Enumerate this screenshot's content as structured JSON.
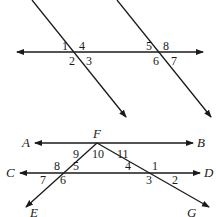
{
  "diagram1": {
    "transversal_line": {
      "x1": 17,
      "y1": 52,
      "x2": 203,
      "y2": 52
    },
    "parallel_lines": [
      {
        "x1": 32,
        "y1": 0,
        "x2": 126,
        "y2": 117
      },
      {
        "x1": 117,
        "y1": 0,
        "x2": 211,
        "y2": 117
      }
    ],
    "angle_labels": [
      {
        "label": "1",
        "x": 62,
        "y": 50
      },
      {
        "label": "4",
        "x": 79,
        "y": 50
      },
      {
        "label": "2",
        "x": 69,
        "y": 65
      },
      {
        "label": "3",
        "x": 86,
        "y": 65
      },
      {
        "label": "5",
        "x": 146,
        "y": 50
      },
      {
        "label": "8",
        "x": 163,
        "y": 50
      },
      {
        "label": "6",
        "x": 153,
        "y": 65
      },
      {
        "label": "7",
        "x": 171,
        "y": 65
      }
    ]
  },
  "diagram2": {
    "lines": [
      {
        "name": "AB",
        "x1": 35,
        "y1": 143,
        "x2": 193,
        "y2": 143
      },
      {
        "name": "CD",
        "x1": 20,
        "y1": 173,
        "x2": 200,
        "y2": 173
      },
      {
        "name": "FE",
        "x1": 97,
        "y1": 143,
        "x2": 26,
        "y2": 207
      },
      {
        "name": "FG",
        "x1": 97,
        "y1": 143,
        "x2": 209,
        "y2": 207
      }
    ],
    "point_labels": [
      {
        "label": "A",
        "x": 22,
        "y": 147
      },
      {
        "label": "B",
        "x": 197,
        "y": 147
      },
      {
        "label": "C",
        "x": 6,
        "y": 177
      },
      {
        "label": "D",
        "x": 204,
        "y": 177
      },
      {
        "label": "F",
        "x": 93,
        "y": 138
      },
      {
        "label": "E",
        "x": 30,
        "y": 217
      },
      {
        "label": "G",
        "x": 187,
        "y": 217
      }
    ],
    "angle_labels": [
      {
        "label": "9",
        "x": 73,
        "y": 158
      },
      {
        "label": "10",
        "x": 92,
        "y": 158
      },
      {
        "label": "11",
        "x": 117,
        "y": 158
      },
      {
        "label": "8",
        "x": 54,
        "y": 170
      },
      {
        "label": "5",
        "x": 73,
        "y": 170
      },
      {
        "label": "7",
        "x": 40,
        "y": 184
      },
      {
        "label": "6",
        "x": 60,
        "y": 184
      },
      {
        "label": "4",
        "x": 125,
        "y": 170
      },
      {
        "label": "1",
        "x": 152,
        "y": 170
      },
      {
        "label": "3",
        "x": 146,
        "y": 184
      },
      {
        "label": "2",
        "x": 172,
        "y": 184
      }
    ]
  },
  "colors": {
    "stroke": "#1a1a1a",
    "background": "#ffffff"
  }
}
